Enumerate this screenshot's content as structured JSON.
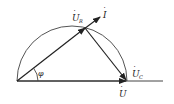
{
  "diagram": {
    "type": "phasor-diagram",
    "labels": {
      "ur": "U",
      "ur_sub": "R",
      "i": "I",
      "uc": "U",
      "uc_sub": "C",
      "u": "U",
      "phi": "φ"
    },
    "colors": {
      "stroke": "#333333",
      "text": "#222222",
      "background": "#ffffff"
    }
  }
}
